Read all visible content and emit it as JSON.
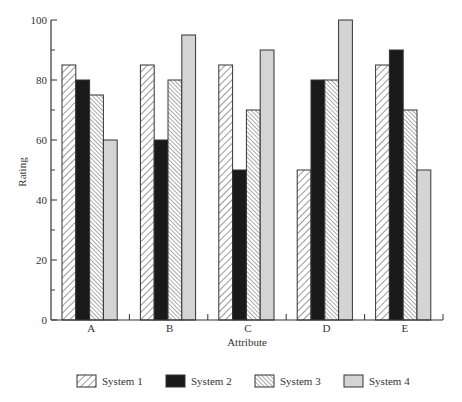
{
  "chart_data": {
    "type": "bar",
    "title": "",
    "xlabel": "Attribute",
    "ylabel": "Rating",
    "ylim": [
      0,
      100
    ],
    "yticks": [
      0,
      20,
      40,
      60,
      80,
      100
    ],
    "grid": false,
    "legend_position": "bottom",
    "categories": [
      "A",
      "B",
      "C",
      "D",
      "E"
    ],
    "series": [
      {
        "name": "System 1",
        "pattern": "hatch-wide",
        "values": [
          85,
          85,
          85,
          50,
          85
        ]
      },
      {
        "name": "System 2",
        "pattern": "solid-black",
        "values": [
          80,
          60,
          50,
          80,
          90
        ]
      },
      {
        "name": "System 3",
        "pattern": "hatch-dense",
        "values": [
          75,
          80,
          70,
          80,
          70
        ]
      },
      {
        "name": "System 4",
        "pattern": "solid-gray",
        "values": [
          60,
          95,
          90,
          100,
          50
        ]
      }
    ]
  },
  "colors": {
    "axis": "#333333",
    "system2": "#1a1a1a",
    "system4": "#d4d4d4"
  }
}
